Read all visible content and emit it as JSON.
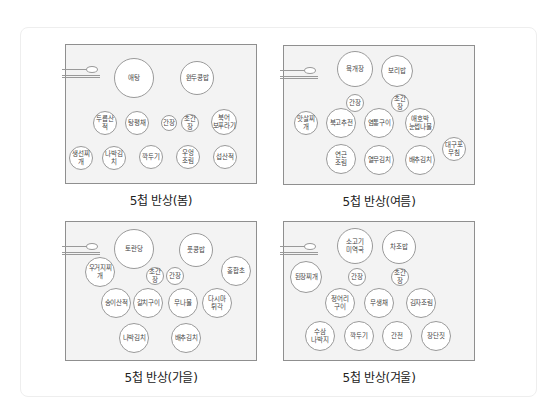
{
  "panels": [
    {
      "id": "spring",
      "caption": "5첩 반상(봄)",
      "dishes": [
        {
          "label": "애탕",
          "x": 134,
          "y": 78,
          "r": 20
        },
        {
          "label": "완두콩밥",
          "x": 197,
          "y": 78,
          "r": 17
        },
        {
          "label": "두릅산적",
          "x": 105,
          "y": 123,
          "r": 12
        },
        {
          "label": "탕평채",
          "x": 137,
          "y": 123,
          "r": 12
        },
        {
          "label": "간장",
          "x": 169,
          "y": 123,
          "r": 8
        },
        {
          "label": "초간장",
          "x": 190,
          "y": 123,
          "r": 9
        },
        {
          "label": "북어\n보푸라기",
          "x": 224,
          "y": 122,
          "r": 13
        },
        {
          "label": "생선찌개",
          "x": 81,
          "y": 158,
          "r": 12
        },
        {
          "label": "나박김치",
          "x": 114,
          "y": 158,
          "r": 12
        },
        {
          "label": "깍두기",
          "x": 151,
          "y": 157,
          "r": 12
        },
        {
          "label": "우엉\n조림",
          "x": 188,
          "y": 157,
          "r": 12
        },
        {
          "label": "섭산적",
          "x": 225,
          "y": 157,
          "r": 12
        }
      ]
    },
    {
      "id": "summer",
      "caption": "5첩 반상(여름)",
      "dishes": [
        {
          "label": "육개장",
          "x": 355,
          "y": 69,
          "r": 18
        },
        {
          "label": "보리밥",
          "x": 397,
          "y": 71,
          "r": 16
        },
        {
          "label": "간장",
          "x": 355,
          "y": 103,
          "r": 9
        },
        {
          "label": "초간장",
          "x": 400,
          "y": 103,
          "r": 9
        },
        {
          "label": "맛살찌개",
          "x": 306,
          "y": 123,
          "r": 12
        },
        {
          "label": "북고추전",
          "x": 341,
          "y": 123,
          "r": 15
        },
        {
          "label": "염통구이",
          "x": 379,
          "y": 123,
          "r": 15
        },
        {
          "label": "애호박\n눈썹나물",
          "x": 420,
          "y": 123,
          "r": 15
        },
        {
          "label": "대구포\n무침",
          "x": 454,
          "y": 149,
          "r": 12
        },
        {
          "label": "연근\n조림",
          "x": 341,
          "y": 159,
          "r": 15
        },
        {
          "label": "열무김치",
          "x": 379,
          "y": 160,
          "r": 15
        },
        {
          "label": "배추김치",
          "x": 420,
          "y": 160,
          "r": 15
        }
      ]
    },
    {
      "id": "autumn",
      "caption": "5첩 반상(가을)",
      "dishes": [
        {
          "label": "토란당",
          "x": 134,
          "y": 249,
          "r": 20
        },
        {
          "label": "풋콩밥",
          "x": 196,
          "y": 250,
          "r": 17
        },
        {
          "label": "우거지찌개",
          "x": 100,
          "y": 272,
          "r": 15
        },
        {
          "label": "초간장",
          "x": 155,
          "y": 276,
          "r": 9
        },
        {
          "label": "간장",
          "x": 175,
          "y": 276,
          "r": 9
        },
        {
          "label": "홍합초",
          "x": 236,
          "y": 271,
          "r": 15
        },
        {
          "label": "송이산적",
          "x": 116,
          "y": 303,
          "r": 15
        },
        {
          "label": "갈치구이",
          "x": 148,
          "y": 303,
          "r": 15
        },
        {
          "label": "무나물",
          "x": 183,
          "y": 303,
          "r": 15
        },
        {
          "label": "다시마\n튀각",
          "x": 217,
          "y": 303,
          "r": 15
        },
        {
          "label": "나박김치",
          "x": 134,
          "y": 338,
          "r": 15
        },
        {
          "label": "배추김치",
          "x": 186,
          "y": 338,
          "r": 15
        }
      ]
    },
    {
      "id": "winter",
      "caption": "5첩 반상(겨울)",
      "dishes": [
        {
          "label": "소고기\n미역국",
          "x": 355,
          "y": 246,
          "r": 18
        },
        {
          "label": "차조밥",
          "x": 399,
          "y": 247,
          "r": 17
        },
        {
          "label": "된장찌개",
          "x": 306,
          "y": 277,
          "r": 16
        },
        {
          "label": "간장",
          "x": 357,
          "y": 277,
          "r": 9
        },
        {
          "label": "초간장",
          "x": 400,
          "y": 277,
          "r": 9
        },
        {
          "label": "정어리\n구이",
          "x": 340,
          "y": 303,
          "r": 15
        },
        {
          "label": "무생채",
          "x": 379,
          "y": 303,
          "r": 15
        },
        {
          "label": "김자조림",
          "x": 421,
          "y": 303,
          "r": 15
        },
        {
          "label": "수삼\n나박지",
          "x": 320,
          "y": 336,
          "r": 15
        },
        {
          "label": "깍두기",
          "x": 359,
          "y": 336,
          "r": 15
        },
        {
          "label": "간전",
          "x": 397,
          "y": 336,
          "r": 15
        },
        {
          "label": "장단짓",
          "x": 436,
          "y": 336,
          "r": 15
        }
      ]
    }
  ]
}
